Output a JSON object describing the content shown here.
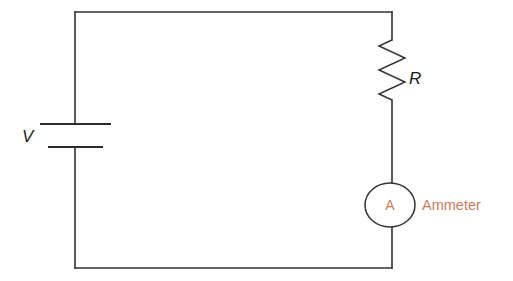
{
  "figure": {
    "kind": "circuit-diagram",
    "background_color": "#ffffff",
    "wire_color": "#333333",
    "accent_color": "#c87d5f"
  },
  "labels": {
    "voltage_source": "V",
    "resistor": "R",
    "ammeter_symbol": "A",
    "ammeter_caption": "Ammeter"
  },
  "components": [
    {
      "id": "battery",
      "name": "battery",
      "symbol_label": "V",
      "position": "left-side",
      "plate_count": 2
    },
    {
      "id": "resistor",
      "name": "resistor",
      "symbol_label": "R",
      "position": "right-side-upper",
      "zigzag_cycles": 5
    },
    {
      "id": "ammeter",
      "name": "ammeter",
      "symbol_label": "A",
      "caption": "Ammeter",
      "position": "right-side-lower"
    }
  ],
  "geometry": {
    "loop": {
      "left": 75,
      "right": 392,
      "top": 12,
      "bottom": 268
    },
    "battery": {
      "long_plate": {
        "x1": 40,
        "x2": 111,
        "y": 124
      },
      "short_plate": {
        "x1": 48,
        "x2": 103,
        "y": 147
      },
      "label_pos": {
        "x": 22,
        "y": 142
      }
    },
    "resistor": {
      "zigzag_top": 40,
      "zigzag_bottom": 100,
      "amplitude": 13,
      "label_pos": {
        "x": 409,
        "y": 84
      }
    },
    "ammeter": {
      "center": {
        "x": 390,
        "y": 205
      },
      "rx": 25,
      "ry": 22,
      "letter_pos": {
        "x": 390,
        "y": 210
      },
      "caption_pos": {
        "x": 422,
        "y": 210
      }
    }
  }
}
